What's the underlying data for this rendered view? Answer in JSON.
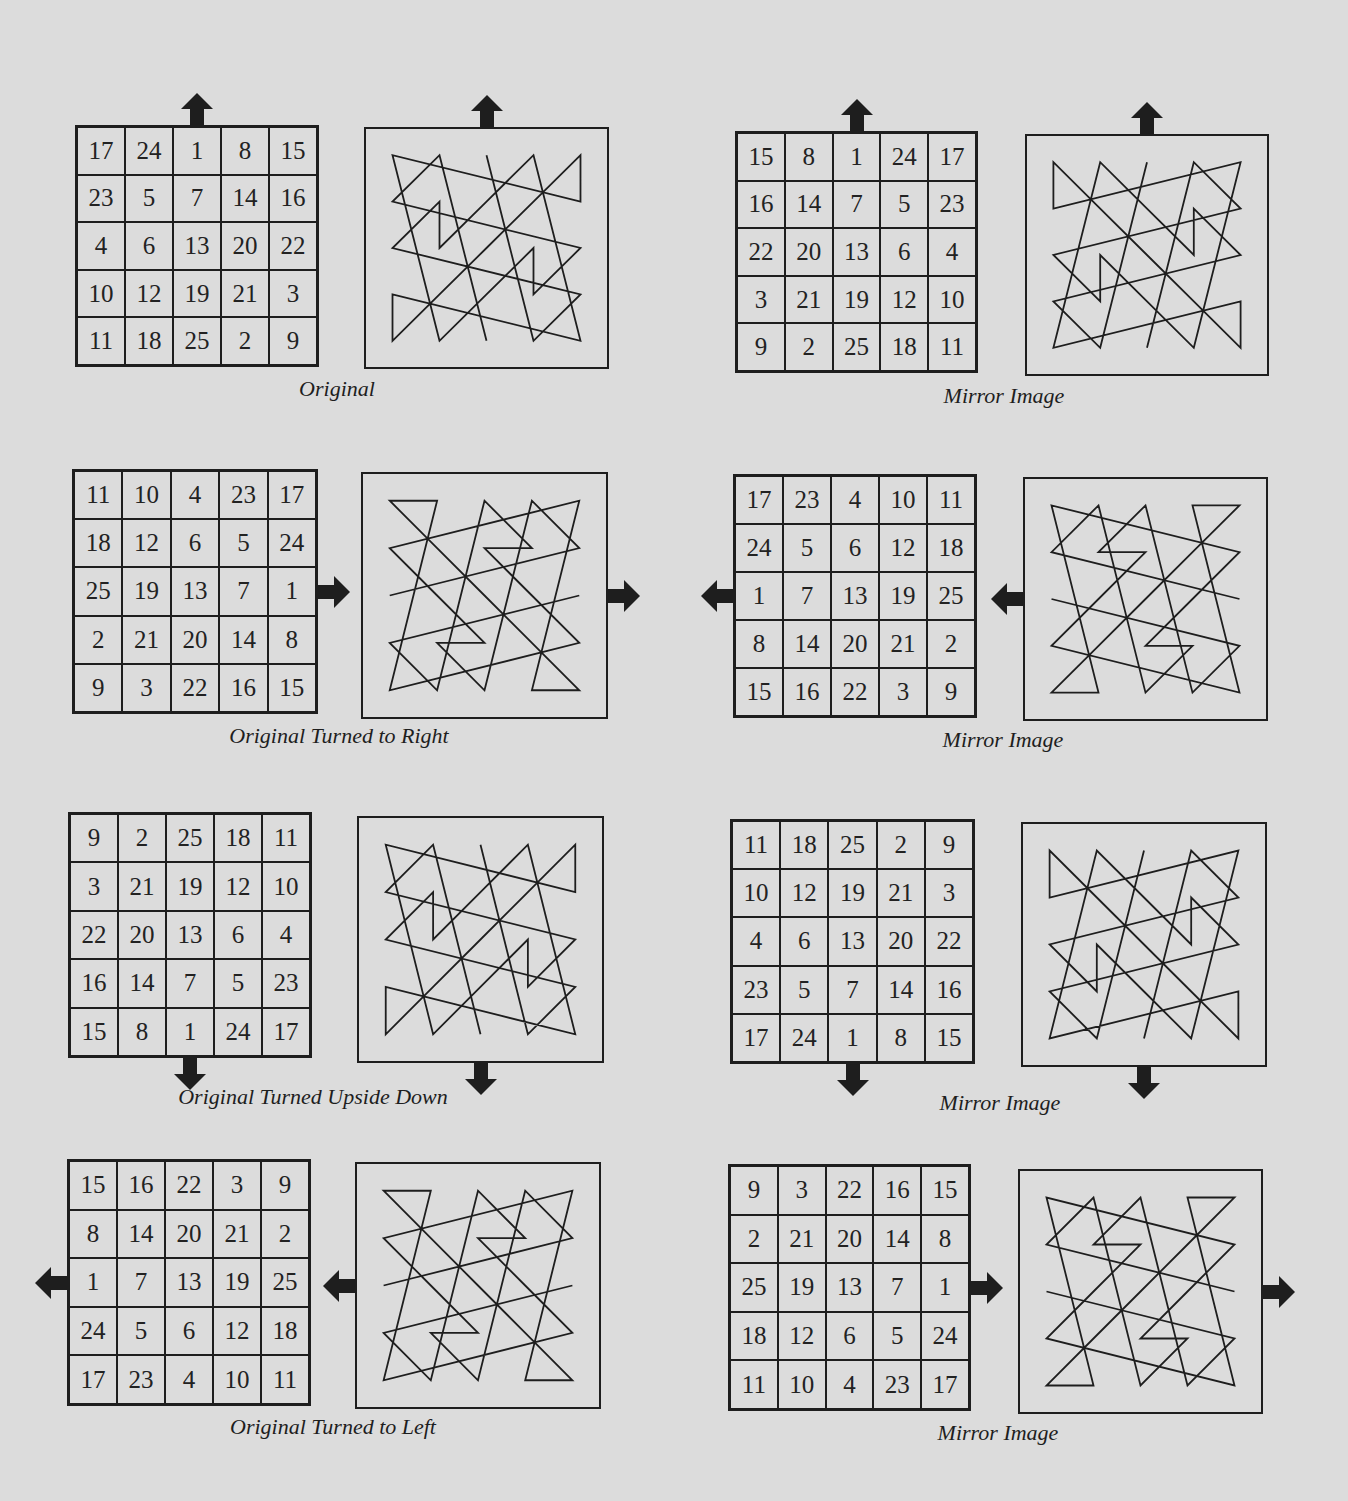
{
  "colors": {
    "background": "#dcdcdc",
    "ink": "#1e1e1e"
  },
  "panels": [
    {
      "id": "original",
      "caption": "Original",
      "arrow": "up",
      "grid": [
        [
          17,
          24,
          1,
          8,
          15
        ],
        [
          23,
          5,
          7,
          14,
          16
        ],
        [
          4,
          6,
          13,
          20,
          22
        ],
        [
          10,
          12,
          19,
          21,
          3
        ],
        [
          11,
          18,
          25,
          2,
          9
        ]
      ]
    },
    {
      "id": "original-mirror",
      "caption": "Mirror Image",
      "arrow": "up",
      "grid": [
        [
          15,
          8,
          1,
          24,
          17
        ],
        [
          16,
          14,
          7,
          5,
          23
        ],
        [
          22,
          20,
          13,
          6,
          4
        ],
        [
          3,
          21,
          19,
          12,
          10
        ],
        [
          9,
          2,
          25,
          18,
          11
        ]
      ]
    },
    {
      "id": "turned-right",
      "caption": "Original Turned to Right",
      "arrow": "right",
      "grid": [
        [
          11,
          10,
          4,
          23,
          17
        ],
        [
          18,
          12,
          6,
          5,
          24
        ],
        [
          25,
          19,
          13,
          7,
          1
        ],
        [
          2,
          21,
          20,
          14,
          8
        ],
        [
          9,
          3,
          22,
          16,
          15
        ]
      ]
    },
    {
      "id": "turned-right-mirror",
      "caption": "Mirror Image",
      "arrow": "left",
      "grid": [
        [
          17,
          23,
          4,
          10,
          11
        ],
        [
          24,
          5,
          6,
          12,
          18
        ],
        [
          1,
          7,
          13,
          19,
          25
        ],
        [
          8,
          14,
          20,
          21,
          2
        ],
        [
          15,
          16,
          22,
          3,
          9
        ]
      ]
    },
    {
      "id": "upside-down",
      "caption": "Original Turned Upside Down",
      "arrow": "down",
      "grid": [
        [
          9,
          2,
          25,
          18,
          11
        ],
        [
          3,
          21,
          19,
          12,
          10
        ],
        [
          22,
          20,
          13,
          6,
          4
        ],
        [
          16,
          14,
          7,
          5,
          23
        ],
        [
          15,
          8,
          1,
          24,
          17
        ]
      ]
    },
    {
      "id": "upside-down-mirror",
      "caption": "Mirror Image",
      "arrow": "down",
      "grid": [
        [
          11,
          18,
          25,
          2,
          9
        ],
        [
          10,
          12,
          19,
          21,
          3
        ],
        [
          4,
          6,
          13,
          20,
          22
        ],
        [
          23,
          5,
          7,
          14,
          16
        ],
        [
          17,
          24,
          1,
          8,
          15
        ]
      ]
    },
    {
      "id": "turned-left",
      "caption": "Original Turned to Left",
      "arrow": "left",
      "grid": [
        [
          15,
          16,
          22,
          3,
          9
        ],
        [
          8,
          14,
          20,
          21,
          2
        ],
        [
          1,
          7,
          13,
          19,
          25
        ],
        [
          24,
          5,
          6,
          12,
          18
        ],
        [
          17,
          23,
          4,
          10,
          11
        ]
      ]
    },
    {
      "id": "turned-left-mirror",
      "caption": "Mirror Image",
      "arrow": "right",
      "grid": [
        [
          9,
          3,
          22,
          16,
          15
        ],
        [
          2,
          21,
          20,
          14,
          8
        ],
        [
          25,
          19,
          13,
          7,
          1
        ],
        [
          18,
          12,
          6,
          5,
          24
        ],
        [
          11,
          10,
          4,
          23,
          17
        ]
      ]
    }
  ]
}
